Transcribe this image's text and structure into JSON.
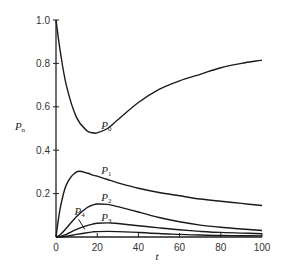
{
  "chart_data": {
    "type": "line",
    "title": "",
    "xlabel": "t",
    "ylabel": "P_n",
    "xlim": [
      0,
      100
    ],
    "ylim": [
      0,
      1.0
    ],
    "grid": false,
    "legend": "inline labels on curves",
    "x_ticks": [
      0,
      20,
      40,
      60,
      80,
      100
    ],
    "x_tick_labels": [
      "0",
      "20",
      "40",
      "60",
      "80",
      "100"
    ],
    "y_ticks": [
      0.2,
      0.4,
      0.6,
      0.8,
      1.0
    ],
    "y_tick_labels": [
      "0.2",
      "0.4",
      "0.6",
      "0.8",
      "1.0"
    ],
    "x": [
      0,
      2,
      5,
      10,
      15,
      18,
      20,
      25,
      30,
      40,
      50,
      60,
      70,
      80,
      90,
      100
    ],
    "series": [
      {
        "name": "P0",
        "label_main": "P",
        "label_sub": "0",
        "label_at": [
          22,
          0.5
        ],
        "values": [
          1.0,
          0.86,
          0.7,
          0.55,
          0.49,
          0.48,
          0.48,
          0.5,
          0.54,
          0.62,
          0.68,
          0.72,
          0.75,
          0.78,
          0.8,
          0.815
        ]
      },
      {
        "name": "P1",
        "label_main": "P",
        "label_sub": "1",
        "label_at": [
          22,
          0.29
        ],
        "values": [
          0.0,
          0.13,
          0.24,
          0.3,
          0.295,
          0.285,
          0.28,
          0.265,
          0.25,
          0.225,
          0.205,
          0.19,
          0.175,
          0.165,
          0.155,
          0.145
        ]
      },
      {
        "name": "P2",
        "label_main": "P",
        "label_sub": "2",
        "label_at": [
          22,
          0.165
        ],
        "values": [
          0.0,
          0.01,
          0.04,
          0.095,
          0.135,
          0.148,
          0.152,
          0.15,
          0.14,
          0.115,
          0.09,
          0.07,
          0.055,
          0.045,
          0.037,
          0.03
        ]
      },
      {
        "name": "P3",
        "label_main": "P",
        "label_sub": "3",
        "label_at": [
          22,
          0.075
        ],
        "values": [
          0.0,
          0.002,
          0.012,
          0.035,
          0.052,
          0.06,
          0.063,
          0.065,
          0.062,
          0.052,
          0.042,
          0.033,
          0.026,
          0.021,
          0.018,
          0.015
        ]
      },
      {
        "name": "P4",
        "label_main": "P",
        "label_sub": "4",
        "label_at": [
          9,
          0.1
        ],
        "arrow_to": [
          14,
          0.035
        ],
        "values": [
          0.0,
          0.0,
          0.003,
          0.012,
          0.02,
          0.024,
          0.025,
          0.026,
          0.025,
          0.021,
          0.016,
          0.012,
          0.009,
          0.007,
          0.006,
          0.005
        ]
      }
    ]
  }
}
